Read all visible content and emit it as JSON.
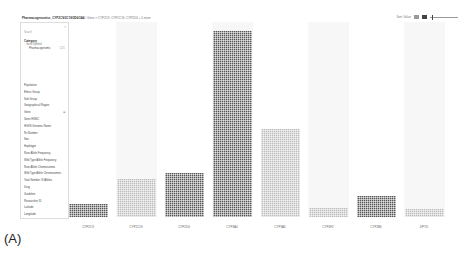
{
  "toolbar": {
    "breadcrumb_prefix": "Pharmacogenomics_CYP2C9/2C19/2D6/3A4",
    "breadcrumb_sep": " / ",
    "breadcrumb_path": "Gene > CYP2C9, CYP2C19, CYP2D6 + 5 more",
    "right_label": "Sort: Value",
    "slider_position": 1
  },
  "sidebar": {
    "close_glyph": "×",
    "search_placeholder": "Search",
    "category_header": "Category",
    "category_sub": "Gene Symbol",
    "category_item": "Pharmacogenomic",
    "category_item_count": "1231",
    "items": [
      {
        "label": "Population"
      },
      {
        "label": "Ethnic Group"
      },
      {
        "label": "Sub Group"
      },
      {
        "label": "Geographical Region"
      },
      {
        "label": "Gene",
        "expandable": true
      },
      {
        "label": "Gene HGNC"
      },
      {
        "label": "HGVS Genomic Name"
      },
      {
        "label": "Rs Number"
      },
      {
        "label": "Star"
      },
      {
        "label": "Haplotype"
      },
      {
        "label": "Rare Allele Frequency"
      },
      {
        "label": "Wild Type Allele Frequency"
      },
      {
        "label": "Rare Allele Chromosomes"
      },
      {
        "label": "Wild Type Allele Chromosomes"
      },
      {
        "label": "Total Number Of Alleles"
      },
      {
        "label": "Drug"
      },
      {
        "label": "Guideline"
      },
      {
        "label": "Researcher ID"
      },
      {
        "label": "Latitude"
      },
      {
        "label": "Longitude"
      }
    ]
  },
  "chart_data": {
    "type": "bar",
    "title": "",
    "xlabel": "",
    "ylabel": "",
    "grid": false,
    "legend": "none",
    "categories": [
      "CYP2C9",
      "CYP2C19",
      "CYP2D6",
      "CYP3A4",
      "CYP3A5",
      "CYP4F2",
      "CYP2B6",
      "DPYD"
    ],
    "values": [
      13,
      38,
      44,
      186,
      88,
      9,
      21,
      8
    ],
    "shades": [
      "dark",
      "light",
      "dark",
      "dark",
      "light",
      "light",
      "dark",
      "light"
    ],
    "ylim": [
      0,
      195
    ],
    "style": "waffle-tiled bars"
  },
  "panel_label": "(A)"
}
